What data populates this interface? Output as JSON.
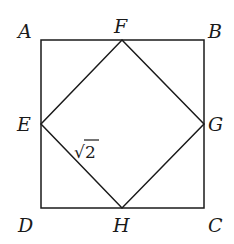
{
  "diagram": {
    "stroke_color": "#1a1a1a",
    "background": "#ffffff",
    "outer_square": [
      "A",
      "B",
      "C",
      "D"
    ],
    "inner_square": [
      "E",
      "F",
      "G",
      "H"
    ],
    "vertices": {
      "A": {
        "label": "A",
        "x": 41,
        "y": 40
      },
      "B": {
        "label": "B",
        "x": 204,
        "y": 40
      },
      "C": {
        "label": "C",
        "x": 204,
        "y": 208
      },
      "D": {
        "label": "D",
        "x": 41,
        "y": 208
      },
      "E": {
        "label": "E",
        "x": 41,
        "y": 124
      },
      "F": {
        "label": "F",
        "x": 122,
        "y": 40
      },
      "G": {
        "label": "G",
        "x": 204,
        "y": 124
      },
      "H": {
        "label": "H",
        "x": 122,
        "y": 208
      }
    },
    "segment_labels": [
      {
        "segment": "EH",
        "root_sign": "√",
        "radicand": "2"
      }
    ]
  }
}
